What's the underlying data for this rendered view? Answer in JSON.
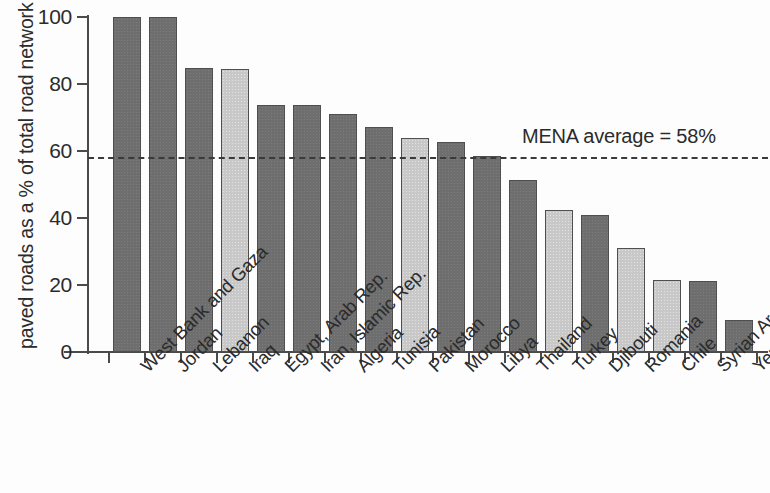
{
  "chart_data": {
    "type": "bar",
    "title": "",
    "subtitle": "",
    "xlabel": "",
    "ylabel": "paved roads as a % of total road network",
    "ylim": [
      0,
      100
    ],
    "ytick_labels": [
      "0",
      "20",
      "40",
      "60",
      "80",
      "100"
    ],
    "ytick_values": [
      0,
      20,
      40,
      60,
      80,
      100
    ],
    "grid": false,
    "legend": "none",
    "categories": [
      "West Bank and Gaza",
      "Jordan",
      "Lebanon",
      "Iraq",
      "Egypt, Arab Rep.",
      "Iran, Islamic Rep.",
      "Algeria",
      "Tunisia",
      "Pakistan",
      "Morocco",
      "Libya",
      "Thailand",
      "Turkey",
      "Djibouti",
      "Romania",
      "Chile",
      "Syrian Arab Republic",
      "Yemen, Rep."
    ],
    "values": [
      100,
      100,
      84.7,
      84.6,
      73.6,
      73.6,
      71,
      67.2,
      63.8,
      62.6,
      58.6,
      51.2,
      42.5,
      41,
      31.1,
      21.6,
      21.2,
      9.6
    ],
    "bar_shades": [
      "dark",
      "dark",
      "dark",
      "light",
      "dark",
      "dark",
      "dark",
      "dark",
      "light",
      "dark",
      "dark",
      "dark",
      "light",
      "dark",
      "light",
      "light",
      "dark",
      "dark"
    ],
    "annotations": [
      {
        "name": "mena-average",
        "text": "MENA average = 58%",
        "value": 58,
        "line_style": "dashed"
      }
    ],
    "colors": {
      "bar_dark": "#6e6e6e",
      "bar_light": "#c8c8c8",
      "bar_edge": "#4f4f4f",
      "axis": "#4a4a4a",
      "text": "#2b2b2b",
      "background": "#fdfdfd",
      "reference_line": "#3a3a3a"
    }
  }
}
